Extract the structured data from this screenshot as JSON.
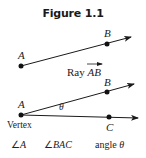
{
  "title": "Figure 1.1",
  "figure_top": {
    "points": {
      "A": "A",
      "B": "B"
    },
    "caption_prefix": "Ray ",
    "caption_ray": "AB"
  },
  "figure_bottom": {
    "points": {
      "A": "A",
      "B": "B",
      "C": "C"
    },
    "vertex_label": "Vertex",
    "angle_symbol": "θ"
  },
  "notations": [
    {
      "symbol": "∠",
      "name": "A"
    },
    {
      "symbol": "∠",
      "name": "BAC"
    },
    {
      "prefix": "angle ",
      "name": "θ"
    }
  ],
  "colors": {
    "line": "#1a1a1a",
    "text": "#222222"
  }
}
